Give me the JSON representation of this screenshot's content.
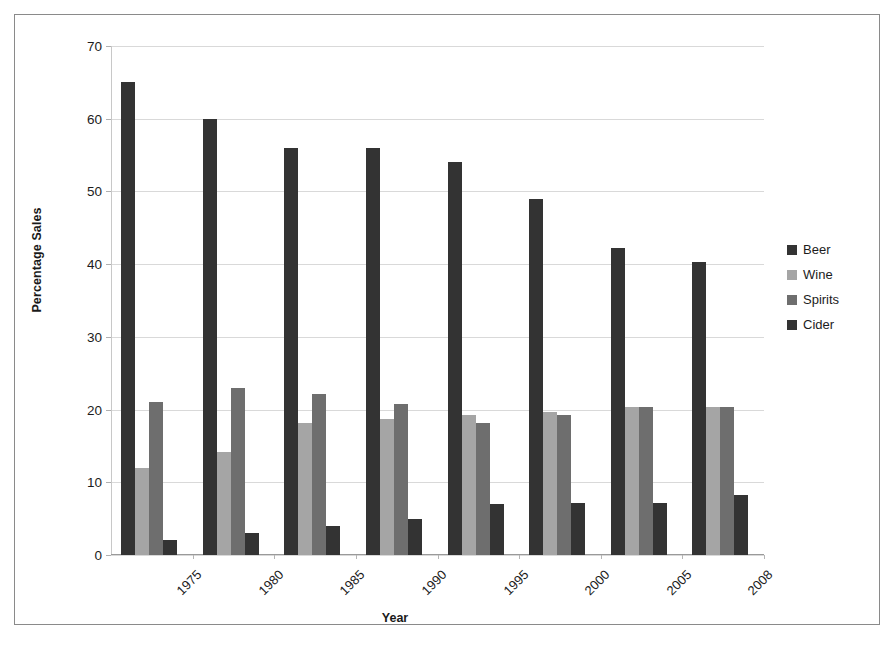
{
  "chart_data": {
    "type": "bar",
    "title": "",
    "xlabel": "Year",
    "ylabel": "Percentage Sales",
    "categories": [
      "1975",
      "1980",
      "1985",
      "1990",
      "1995",
      "2000",
      "2005",
      "2008"
    ],
    "series": [
      {
        "name": "Beer",
        "color": "#333333",
        "values": [
          65,
          60,
          56,
          56,
          54,
          49,
          42.2,
          40.3
        ]
      },
      {
        "name": "Wine",
        "color": "#a5a5a5",
        "values": [
          12,
          14.2,
          18.2,
          18.7,
          19.2,
          19.7,
          20.3,
          20.3
        ]
      },
      {
        "name": "Spirits",
        "color": "#6e6e6e",
        "values": [
          21,
          23,
          22.1,
          20.7,
          18.2,
          19.2,
          20.3,
          20.3
        ]
      },
      {
        "name": "Cider",
        "color": "#333333",
        "values": [
          2,
          3,
          4,
          5,
          7,
          7.2,
          7.2,
          8.2
        ]
      }
    ],
    "ylim": [
      0,
      70
    ],
    "yticks": [
      0,
      10,
      20,
      30,
      40,
      50,
      60,
      70
    ],
    "ytick_labels": [
      "0",
      "10",
      "20",
      "30",
      "40",
      "50",
      "60",
      "70"
    ],
    "grid": true,
    "legend_position": "right",
    "xtick_rotation": -45
  },
  "axes": {
    "y_title": "Percentage Sales",
    "x_title": "Year"
  },
  "legend": {
    "entries": [
      {
        "label": "Beer",
        "color": "#333333"
      },
      {
        "label": "Wine",
        "color": "#a5a5a5"
      },
      {
        "label": "Spirits",
        "color": "#6e6e6e"
      },
      {
        "label": "Cider",
        "color": "#333333"
      }
    ]
  }
}
